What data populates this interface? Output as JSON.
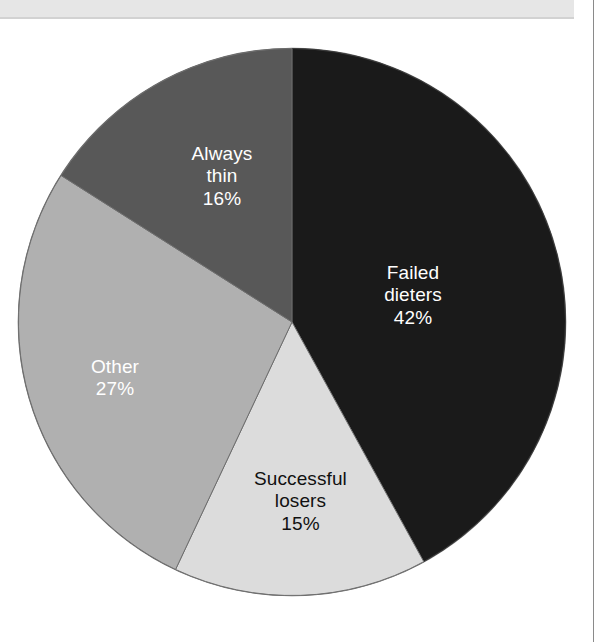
{
  "page": {
    "background_color": "#ffffff",
    "top_band_color": "#e6e6e6",
    "rule_color": "#8a8a8a"
  },
  "chart_data": {
    "type": "pie",
    "title": "",
    "subtitle": "",
    "xlabel": "",
    "ylabel": "",
    "legend_position": "none",
    "grid": false,
    "labels_inside_slices": true,
    "total_percent": 100,
    "categories": [
      "Failed dieters",
      "Successful losers",
      "Other",
      "Always thin"
    ],
    "values": [
      42,
      15,
      27,
      16
    ],
    "slices": [
      {
        "name": "failed-dieters",
        "label": "Failed dieters",
        "label_line1": "Failed",
        "label_line2": "dieters",
        "value": 42,
        "percent_text": "42%",
        "color": "#1a1a1a",
        "text_color": "#ffffff",
        "start_angle_deg": 0,
        "end_angle_deg": 151.2
      },
      {
        "name": "successful-losers",
        "label": "Successful losers",
        "label_line1": "Successful",
        "label_line2": "losers",
        "value": 15,
        "percent_text": "15%",
        "color": "#dcdcdc",
        "text_color": "#111111",
        "start_angle_deg": 151.2,
        "end_angle_deg": 205.2
      },
      {
        "name": "other",
        "label": "Other",
        "label_line1": "Other",
        "label_line2": "",
        "value": 27,
        "percent_text": "27%",
        "color": "#b0b0b0",
        "text_color": "#ffffff",
        "start_angle_deg": 205.2,
        "end_angle_deg": 302.4
      },
      {
        "name": "always-thin",
        "label": "Always thin",
        "label_line1": "Always",
        "label_line2": "thin",
        "value": 16,
        "percent_text": "16%",
        "color": "#585858",
        "text_color": "#ffffff",
        "start_angle_deg": 302.4,
        "end_angle_deg": 360
      }
    ]
  }
}
